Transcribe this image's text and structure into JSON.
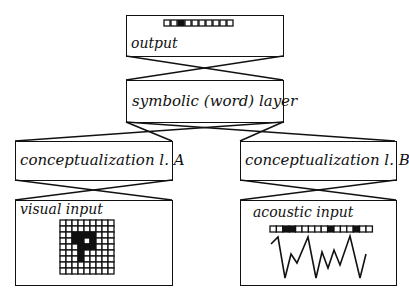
{
  "diagram": {
    "nodes": {
      "output": {
        "label": "output",
        "vector": [
          0,
          0,
          1,
          0,
          0,
          0,
          0,
          0,
          0,
          0
        ]
      },
      "symbolic": {
        "label": "symbolic (word) layer"
      },
      "concA": {
        "label": "conceptualization l. A"
      },
      "concB": {
        "label": "conceptualization l. B"
      },
      "visual": {
        "label": "visual input",
        "grid": [
          [
            0,
            0,
            0,
            0,
            0,
            0,
            0,
            0,
            0
          ],
          [
            0,
            0,
            0,
            0,
            0,
            0,
            0,
            0,
            0
          ],
          [
            0,
            0,
            1,
            1,
            1,
            1,
            0,
            0,
            0
          ],
          [
            0,
            0,
            1,
            1,
            0,
            1,
            0,
            0,
            0
          ],
          [
            0,
            0,
            0,
            1,
            1,
            1,
            0,
            0,
            0
          ],
          [
            0,
            0,
            0,
            1,
            0,
            0,
            0,
            0,
            0
          ],
          [
            0,
            0,
            0,
            1,
            0,
            0,
            0,
            0,
            0
          ],
          [
            0,
            0,
            0,
            0,
            0,
            0,
            0,
            0,
            0
          ],
          [
            0,
            0,
            0,
            0,
            0,
            0,
            0,
            0,
            0
          ]
        ]
      },
      "acoustic": {
        "label": "acoustic input",
        "vector": [
          0,
          0,
          1,
          1,
          0,
          0,
          0,
          0,
          0,
          1,
          0,
          0,
          0,
          1,
          0,
          0
        ],
        "waveform": [
          [
            271,
            244
          ],
          [
            278,
            237
          ],
          [
            285,
            278
          ],
          [
            291,
            254
          ],
          [
            297,
            263
          ],
          [
            308,
            237
          ],
          [
            316,
            278
          ],
          [
            322,
            252
          ],
          [
            328,
            268
          ],
          [
            334,
            250
          ],
          [
            340,
            265
          ],
          [
            350,
            236
          ],
          [
            360,
            278
          ],
          [
            366,
            254
          ]
        ]
      }
    },
    "edges": [
      {
        "from": "symbolic",
        "to": "output",
        "type": "full-connection"
      },
      {
        "from": "concA",
        "to": "symbolic",
        "type": "full-connection"
      },
      {
        "from": "concB",
        "to": "symbolic",
        "type": "full-connection"
      },
      {
        "from": "visual",
        "to": "concA",
        "type": "full-connection"
      },
      {
        "from": "acoustic",
        "to": "concB",
        "type": "full-connection"
      }
    ]
  }
}
